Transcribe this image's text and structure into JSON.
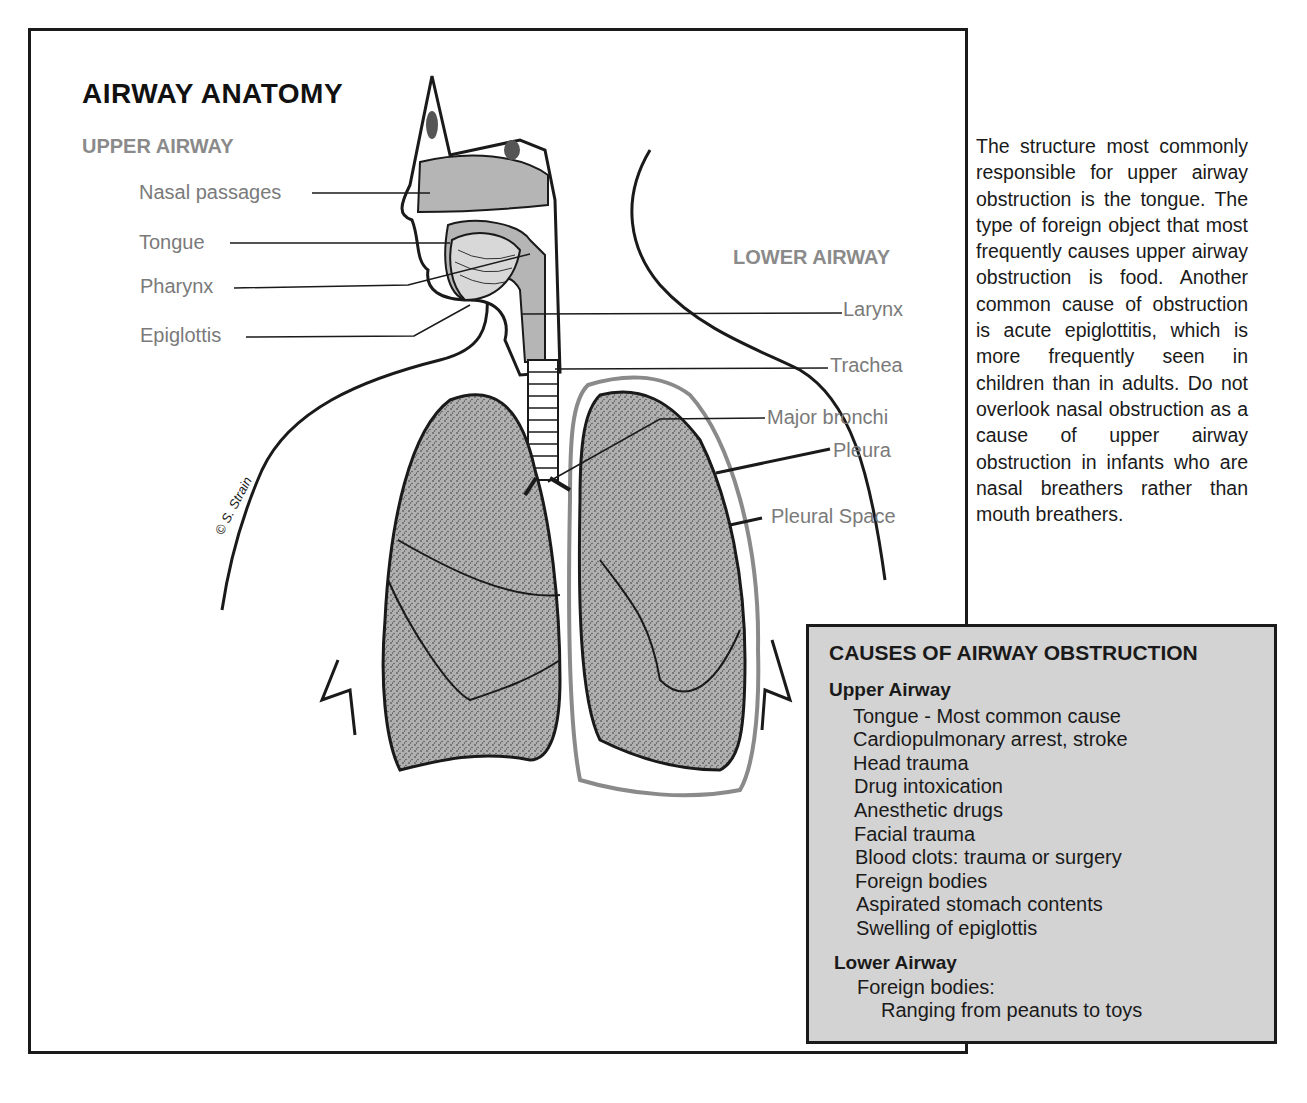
{
  "diagram": {
    "title": "AIRWAY ANATOMY",
    "upper_airway": {
      "heading": "UPPER AIRWAY",
      "labels": [
        "Nasal passages",
        "Tongue",
        "Pharynx",
        "Epiglottis"
      ]
    },
    "lower_airway": {
      "heading": "LOWER AIRWAY",
      "labels": [
        "Larynx",
        "Trachea",
        "Major bronchi",
        "Pleura",
        "Pleural Space"
      ]
    },
    "credit": "© S. Strain"
  },
  "side_text": "The structure most commonly responsible for upper airway obstruction is the tongue. The type of foreign object that most frequently causes upper airway obstruction is food. Another common cause of obstruction is acute epiglottitis, which is more frequently seen in children than in adults. Do not overlook nasal obstruction as a cause of upper airway obstruction in infants who are nasal breathers rather than mouth breathers.",
  "causes_box": {
    "title": "CAUSES OF AIRWAY OBSTRUCTION",
    "upper": {
      "heading": "Upper Airway",
      "items": [
        "Tongue - Most common cause",
        "Cardiopulmonary arrest, stroke",
        "Head trauma",
        "Drug intoxication",
        "Anesthetic drugs",
        "Facial trauma",
        "Blood clots: trauma or surgery",
        "Foreign bodies",
        "Aspirated stomach contents",
        "Swelling of epiglottis"
      ]
    },
    "lower": {
      "heading": "Lower Airway",
      "items": [
        "Foreign bodies:",
        "Ranging from peanuts to toys"
      ]
    }
  },
  "colors": {
    "label_gray": "#7a7a7a",
    "box_fill": "#d3d3d3",
    "lung_fill": "#a8a8a8",
    "airway_fill": "#b5b5b5",
    "ink": "#1a1a1a"
  }
}
